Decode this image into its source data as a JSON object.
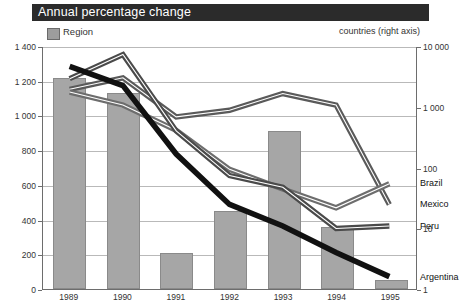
{
  "header": {
    "title": "Annual percentage change"
  },
  "legend": {
    "region_label": "Region",
    "region_swatch_color": "#a6a6a6",
    "right_axis_note": "countries (right axis)"
  },
  "axes": {
    "left": {
      "ticks": [
        "1 400",
        "1 200",
        "1 000",
        "800",
        "600",
        "400",
        "200",
        "0"
      ],
      "min": 0,
      "max": 1400,
      "step": 200,
      "scale": "linear"
    },
    "right": {
      "ticks": [
        "10 000",
        "1 000",
        "100",
        "10",
        "1"
      ],
      "min": 1,
      "max": 10000,
      "scale": "log"
    },
    "x": {
      "ticks": [
        "1989",
        "1990",
        "1991",
        "1992",
        "1993",
        "1994",
        "1995"
      ]
    }
  },
  "series_end_labels": [
    {
      "name": "Mexico",
      "text": "Mexico"
    },
    {
      "name": "Brazil",
      "text": "Brazil"
    },
    {
      "name": "Peru",
      "text": "Peru"
    },
    {
      "name": "Argentina",
      "text": "Argentina"
    }
  ],
  "chart_data": {
    "type": "bar",
    "title": "Annual percentage change",
    "subtitle": "",
    "xlabel": "",
    "ylabel": "",
    "grid": true,
    "legend_position": "top-left",
    "categories": [
      "1989",
      "1990",
      "1991",
      "1992",
      "1993",
      "1994",
      "1995"
    ],
    "y_left": {
      "label": "Region",
      "min": 0,
      "max": 1400,
      "step": 200,
      "scale": "linear",
      "tick_labels": [
        "0",
        "200",
        "400",
        "600",
        "800",
        "1 000",
        "1 200",
        "1 400"
      ]
    },
    "y_right": {
      "label": "countries (right axis)",
      "min": 1,
      "max": 10000,
      "scale": "log",
      "tick_labels": [
        "1",
        "10",
        "100",
        "1 000",
        "10 000"
      ]
    },
    "bars": {
      "name": "Region",
      "axis": "left",
      "color": "#a6a6a6",
      "values": [
        1215,
        1130,
        210,
        450,
        910,
        360,
        55
      ]
    },
    "series": [
      {
        "name": "Mexico",
        "axis": "right",
        "color": "#5a5a5a",
        "style": "line-outlined",
        "values": [
          2000,
          3100,
          700,
          900,
          1700,
          1100,
          25
        ]
      },
      {
        "name": "Brazil",
        "axis": "right",
        "color": "#6d6d6d",
        "style": "line-outlined",
        "values": [
          1800,
          1100,
          420,
          95,
          45,
          22,
          55
        ]
      },
      {
        "name": "Peru",
        "axis": "right",
        "color": "#4a4a4a",
        "style": "line-outlined",
        "values": [
          3000,
          7500,
          410,
          75,
          48,
          10,
          11
        ]
      },
      {
        "name": "Argentina",
        "axis": "right",
        "color": "#111111",
        "style": "line-thick-black",
        "values": [
          4800,
          2300,
          170,
          25,
          11,
          4,
          1.6
        ]
      }
    ]
  }
}
